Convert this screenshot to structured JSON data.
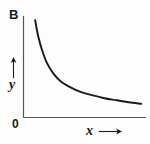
{
  "figure": {
    "name": "inverse-proportion-graph",
    "background_color": "#fdfdfd",
    "line_color": "#1a1a1a",
    "axis_color": "#555555"
  },
  "labels": {
    "top_left_marker": "B",
    "origin": "0",
    "y_axis": "y",
    "x_axis": "x",
    "y_arrow_icon": "up-arrow-icon",
    "x_arrow_icon": "right-arrow-icon"
  },
  "chart_data": {
    "type": "line",
    "title": "",
    "subtitle": "",
    "xlabel": "x",
    "ylabel": "y",
    "annotations": [
      "B",
      "0"
    ],
    "grid": false,
    "legend": null,
    "axis_ticks": false,
    "curve_description": "inverse proportion (hyperbola) y = k / x, decreasing and asymptotic to the x-axis",
    "xlim": [
      0,
      10
    ],
    "ylim": [
      0,
      10
    ],
    "x": [
      0.95,
      1.2,
      1.5,
      1.9,
      2.4,
      3.0,
      3.8,
      4.7,
      5.6,
      6.6,
      7.6,
      8.6,
      9.6
    ],
    "y": [
      9.6,
      8.0,
      6.7,
      5.4,
      4.4,
      3.6,
      3.0,
      2.5,
      2.2,
      1.9,
      1.7,
      1.5,
      1.35
    ],
    "series": [
      {
        "name": "y vs x",
        "values": [
          9.6,
          8.0,
          6.7,
          5.4,
          4.4,
          3.6,
          3.0,
          2.5,
          2.2,
          1.9,
          1.7,
          1.5,
          1.35
        ]
      }
    ]
  }
}
